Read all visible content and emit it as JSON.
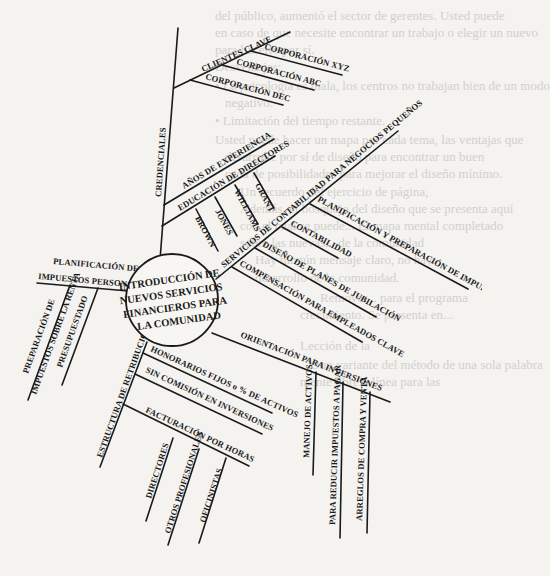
{
  "background_text": [
    "del público, aumentó el sector de gerentes. Usted puede",
    "en caso de que necesite encontrar un trabajo o elegir un nuevo",
    "para hacerlo por sí.",
    "Desventajas:",
    "• La psicología es mala, los centros no trabajan bien de un modo",
    "negativo.",
    "• Limitación del tiempo restante.",
    "Usted puede hacer un mapa por cada tema, las ventajas que",
    "desarrolle por sí de diseño para encontrar un buen",
    "cada de posibilidades para mejorar el diseño mínimo.",
    "Un recuerdo del ejercicio de página,",
    "Además, el bosquejo del diseño que se presenta aquí",
    "con el cual se puede... El mapa mental completado",
    "sobre las nuevas... de la comunidad",
    "Hay ningún mensaje claro, no hay...",
    "desarrollo de la comunidad.",
    "Remover... para el programa",
    "crecimiento. Se presenta en...",
    "Lección de la",
    "Otra variante del método de una sola palabra",
    "mente libre... línea para las"
  ],
  "mind_map": {
    "center": [
      "INTRODUCCIÓN DE",
      "NUEVOS SERVICIOS",
      "FINANCIEROS PARA",
      "LA COMUNIDAD"
    ],
    "credenciales": {
      "label": "CREDENCIALES",
      "clientes_clave": {
        "label": "CLIENTES CLAVE",
        "items": [
          "CORPORACIÓN XYZ",
          "CORPORACIÓN ABC",
          "CORPORACIÓN DEC"
        ]
      },
      "anos_experiencia": "AÑOS DE EXPERIENCIA",
      "educacion_directores": {
        "label": "EDUCACIÓN DE DIRECTORES",
        "items": [
          "BROWN",
          "JONES",
          "WILLIAMS",
          "GRANT"
        ]
      }
    },
    "servicios_contabilidad": {
      "label": "SERVICIOS DE CONTABILIDAD PARA NEGOCIOS PEQUEÑOS",
      "items": [
        "PLANIFICACIÓN Y PREPARACIÓN DE IMPUESTOS",
        "CONTABILIDAD",
        "DISEÑO DE PLANES DE JUBILACIÓN",
        "COMPENSACIÓN PARA EMPLEADOS CLAVE"
      ]
    },
    "impuestos_personales": {
      "label_line1": "PLANIFICACIÓN DE",
      "label_line2": "IMPUESTOS PERSONALES",
      "items": [
        {
          "line1": "PREPARACIÓN DE",
          "line2": "IMPUESTOS SOBRE LA RENTA"
        },
        {
          "line1": "PRESUPUESTADO"
        }
      ]
    },
    "orientacion_inversiones": {
      "label": "ORIENTACIÓN PARA INVERSIONES",
      "items": [
        "MANEJO DE ACTIVOS",
        "PARA REDUCIR IMPUESTOS A PAGAR",
        "ARREGLOS DE COMPRA Y VENTA"
      ]
    },
    "estructura_retribuciones": {
      "label": "ESTRUCTURA DE RETRIBUCIONES",
      "honorarios": "HONORARIOS FIJOS o % DE ACTIVOS",
      "sin_comision": "SIN COMISIÓN EN INVERSIONES",
      "facturacion": {
        "label": "FACTURACIÓN POR HORAS",
        "items": [
          "DIRECTORES",
          "OTROS PROFESIONALES",
          "OFICINISTAS"
        ]
      }
    }
  }
}
